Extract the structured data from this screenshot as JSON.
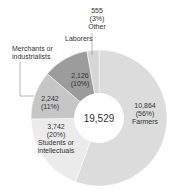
{
  "chart_data": {
    "type": "pie",
    "donut": true,
    "total_label": "19,529",
    "slices": [
      {
        "name": "Farmers",
        "value": 10864,
        "value_label": "10,864",
        "percent_label": "(56%)",
        "label_lines": [
          "Farmers"
        ],
        "color": "#dcdcdc"
      },
      {
        "name": "Students or intellectuals",
        "value": 3742,
        "value_label": "3,742",
        "percent_label": "(20%)",
        "label_lines": [
          "Students or",
          "intellectuals"
        ],
        "color": "#ebebeb"
      },
      {
        "name": "Merchants or industrialists",
        "value": 2242,
        "value_label": "2,242",
        "percent_label": "(11%)",
        "label_lines": [
          "Merchants or",
          "industrialists"
        ],
        "color": "#c6c6c6"
      },
      {
        "name": "Laborers",
        "value": 2126,
        "value_label": "2,126",
        "percent_label": "(10%)",
        "label_lines": [
          "Laborers"
        ],
        "color": "#9c9c9c"
      },
      {
        "name": "Other",
        "value": 555,
        "value_label": "555",
        "percent_label": "(3%)",
        "label_lines": [
          "Other"
        ],
        "color": "#d6d6d6"
      }
    ]
  }
}
